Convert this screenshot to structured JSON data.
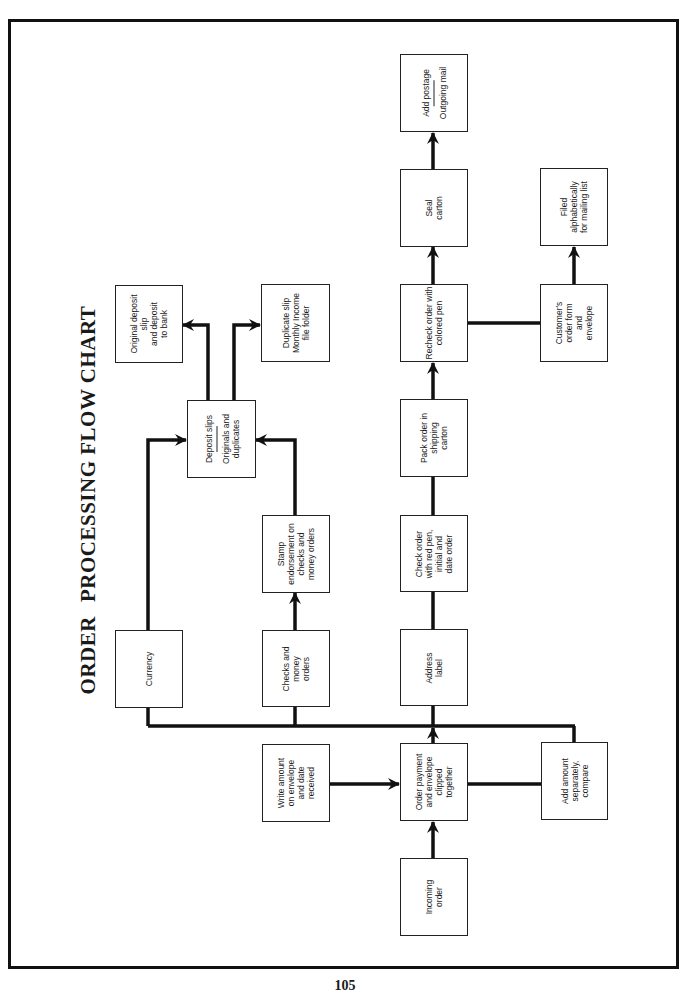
{
  "title": {
    "word1": "ORDER",
    "word2": "PROCESSING FLOW CHART"
  },
  "page_number": "105",
  "boxes": {
    "incoming_order": [
      "Incoming",
      "order"
    ],
    "order_payment": [
      "Order payment",
      "and envelope",
      "clipped",
      "together"
    ],
    "write_amount": [
      "Write amount",
      "on envelope",
      "and date",
      "received"
    ],
    "add_amount": [
      "Add amount",
      "separately,",
      "compare"
    ],
    "currency": [
      "Currency"
    ],
    "checks_money_orders": [
      "Checks and",
      "money",
      "orders"
    ],
    "stamp_endorsement": [
      "Stamp",
      "endorsement on",
      "checks and",
      "money orders"
    ],
    "deposit_slips": {
      "top": "Deposit slips",
      "bottom": [
        "Originals and",
        "duplicates"
      ]
    },
    "original_deposit": [
      "Original deposit",
      "slip",
      "and deposit",
      "to bank"
    ],
    "duplicate_slip": [
      "Duplicate slip",
      "Monthly Income",
      "file folder"
    ],
    "address_label": [
      "Address",
      "label"
    ],
    "check_order": [
      "Check order",
      "with red pen,",
      "initial and",
      "date order"
    ],
    "pack_order": [
      "Pack order in",
      "shipping",
      "carton"
    ],
    "recheck_order": [
      "Recheck order with",
      "colored pen"
    ],
    "seal_carton": [
      "Seal",
      "carton"
    ],
    "add_postage": {
      "top": "Add postage",
      "bottom": [
        "Outgoing mail"
      ]
    },
    "customers_order_form": [
      "Customer's",
      "order form",
      "and",
      "envelope"
    ],
    "filed_alphabetically": [
      "Filed",
      "alphabetically",
      "for mailing list"
    ]
  },
  "colors": {
    "line": "#111111",
    "box_border": "#222222",
    "background": "#ffffff"
  }
}
